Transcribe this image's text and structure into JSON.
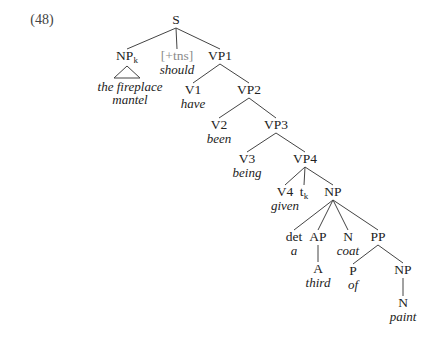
{
  "example_number": "(48)",
  "tree": {
    "nodes": [
      {
        "id": "S",
        "label": "S",
        "x": 176,
        "y": 24
      },
      {
        "id": "NPk",
        "label": "NP",
        "sub": "k",
        "x": 127,
        "y": 60,
        "word_lines": [
          "the fireplace",
          "mantel"
        ],
        "triangle": true
      },
      {
        "id": "tns",
        "label": "[+tns]",
        "x": 177,
        "y": 60,
        "grey": true,
        "word_lines": [
          "should"
        ]
      },
      {
        "id": "VP1",
        "label": "VP1",
        "x": 220,
        "y": 60
      },
      {
        "id": "V1",
        "label": "V1",
        "x": 193,
        "y": 94,
        "word_lines": [
          "have"
        ]
      },
      {
        "id": "VP2",
        "label": "VP2",
        "x": 249,
        "y": 94
      },
      {
        "id": "V2",
        "label": "V2",
        "x": 219,
        "y": 129,
        "word_lines": [
          "been"
        ]
      },
      {
        "id": "VP3",
        "label": "VP3",
        "x": 276,
        "y": 129
      },
      {
        "id": "V3",
        "label": "V3",
        "x": 247,
        "y": 163,
        "word_lines": [
          "being"
        ]
      },
      {
        "id": "VP4",
        "label": "VP4",
        "x": 305,
        "y": 163
      },
      {
        "id": "V4",
        "label": "V4",
        "x": 285,
        "y": 196,
        "word_lines": [
          "given"
        ]
      },
      {
        "id": "tk",
        "label": "t",
        "sub": "k",
        "x": 304,
        "y": 196
      },
      {
        "id": "NP",
        "label": "NP",
        "x": 333,
        "y": 196
      },
      {
        "id": "det",
        "label": "det",
        "x": 294,
        "y": 241,
        "word_lines": [
          "a"
        ]
      },
      {
        "id": "AP",
        "label": "AP",
        "x": 318,
        "y": 241
      },
      {
        "id": "N1",
        "label": "N",
        "x": 348,
        "y": 241,
        "word_lines": [
          "coat"
        ]
      },
      {
        "id": "PP",
        "label": "PP",
        "x": 378,
        "y": 241
      },
      {
        "id": "A",
        "label": "A",
        "x": 318,
        "y": 273,
        "word_lines": [
          "third"
        ]
      },
      {
        "id": "P",
        "label": "P",
        "x": 353,
        "y": 275,
        "word_lines": [
          "of"
        ]
      },
      {
        "id": "NP2",
        "label": "NP",
        "x": 403,
        "y": 274
      },
      {
        "id": "N2",
        "label": "N",
        "x": 403,
        "y": 307,
        "word_lines": [
          "paint"
        ]
      }
    ],
    "edges": [
      [
        "S",
        "NPk"
      ],
      [
        "S",
        "tns"
      ],
      [
        "S",
        "VP1"
      ],
      [
        "VP1",
        "V1"
      ],
      [
        "VP1",
        "VP2"
      ],
      [
        "VP2",
        "V2"
      ],
      [
        "VP2",
        "VP3"
      ],
      [
        "VP3",
        "V3"
      ],
      [
        "VP3",
        "VP4"
      ],
      [
        "VP4",
        "V4"
      ],
      [
        "VP4",
        "tk"
      ],
      [
        "VP4",
        "NP"
      ],
      [
        "NP",
        "det"
      ],
      [
        "NP",
        "AP"
      ],
      [
        "NP",
        "N1"
      ],
      [
        "NP",
        "PP"
      ],
      [
        "AP",
        "A"
      ],
      [
        "PP",
        "P"
      ],
      [
        "PP",
        "NP2"
      ],
      [
        "NP2",
        "N2"
      ]
    ]
  }
}
